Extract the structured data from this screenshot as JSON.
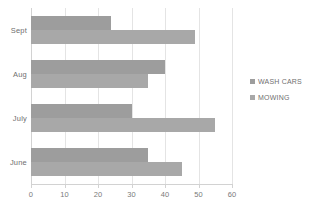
{
  "chart_data": {
    "type": "bar",
    "orientation": "horizontal",
    "title": "",
    "xlabel": "",
    "ylabel": "",
    "categories": [
      "Sept",
      "Aug",
      "July",
      "June"
    ],
    "series": [
      {
        "name": "WASH CARS",
        "color": "#9d9d9d",
        "values": [
          24,
          40,
          30,
          35
        ]
      },
      {
        "name": "MOWING",
        "color": "#a8a8a8",
        "values": [
          49,
          35,
          55,
          45
        ]
      }
    ],
    "xlim": [
      0,
      60
    ],
    "xticks": [
      0,
      10,
      20,
      30,
      40,
      50,
      60
    ],
    "xtick_labels": [
      "0",
      "10",
      "20",
      "30",
      "40",
      "50",
      "60"
    ],
    "grid": true,
    "grid_axis": "x",
    "legend": {
      "position": "right",
      "entries": [
        {
          "label": "WASH CARS",
          "marker": "square",
          "color": "#9d9d9d"
        },
        {
          "label": "MOWING",
          "marker": "square",
          "color": "#a8a8a8"
        }
      ]
    },
    "colors": {
      "series_0": "#9d9d9d",
      "series_1": "#a8a8a8",
      "gridline": "#e4e4e4",
      "axis": "#d2d2d2",
      "text": "#6f6f6f",
      "background": "#ffffff"
    }
  }
}
